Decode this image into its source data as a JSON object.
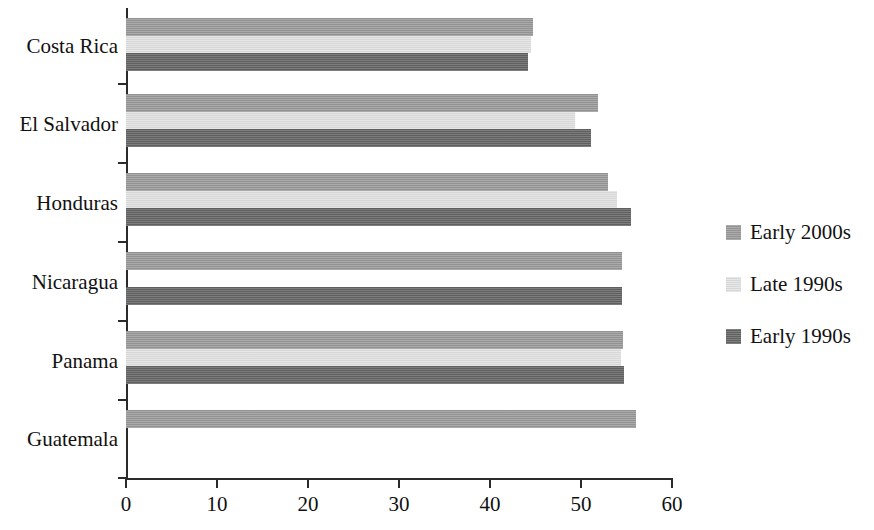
{
  "chart_data": {
    "type": "bar",
    "orientation": "horizontal",
    "title": "",
    "xlabel": "",
    "ylabel": "",
    "categories": [
      "Costa Rica",
      "El Salvador",
      "Honduras",
      "Nicaragua",
      "Panama",
      "Guatemala"
    ],
    "series": [
      {
        "name": "Early 2000s",
        "color": "#9a9a9a",
        "values": [
          44.7,
          51.9,
          53.0,
          54.5,
          54.6,
          56.0
        ]
      },
      {
        "name": "Late 1990s",
        "color": "#e2e2e2",
        "values": [
          44.5,
          49.3,
          54.0,
          null,
          54.4,
          null
        ]
      },
      {
        "name": "Early 1990s",
        "color": "#646464",
        "values": [
          44.2,
          51.1,
          55.5,
          54.5,
          54.7,
          null
        ]
      }
    ],
    "xlim": [
      0,
      60
    ],
    "xticks": [
      0,
      10,
      20,
      30,
      40,
      50,
      60
    ],
    "xtick_labels": [
      "0",
      "10",
      "20",
      "30",
      "40",
      "50",
      "60"
    ],
    "grid": false,
    "legend_position": "right"
  },
  "legend": {
    "entries": [
      {
        "label": "Early 2000s",
        "color": "#9a9a9a"
      },
      {
        "label": "Late 1990s",
        "color": "#e2e2e2"
      },
      {
        "label": "Early 1990s",
        "color": "#646464"
      }
    ]
  },
  "axes": {
    "x_tick_labels": [
      "0",
      "10",
      "20",
      "30",
      "40",
      "50",
      "60"
    ],
    "y_tick_labels": [
      "Costa Rica",
      "El Salvador",
      "Honduras",
      "Nicaragua",
      "Panama",
      "Guatemala"
    ]
  }
}
